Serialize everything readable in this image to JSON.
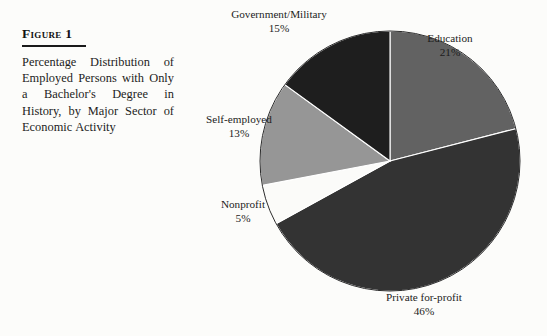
{
  "figure": {
    "label": "Figure 1",
    "caption": "Percentage Distribution of Employed Persons with Only a Bachelor's Degree in History, by Major Sector of Economic Activity"
  },
  "chart_data": {
    "type": "pie",
    "title": "Percentage Distribution of Employed Persons with Only a Bachelor's Degree in History, by Major Sector of Economic Activity",
    "xlabel": "",
    "ylabel": "",
    "legend_position": "none",
    "grid": false,
    "value_suffix": "%",
    "start_angle_deg": 0,
    "direction": "clockwise",
    "categories": [
      "Education",
      "Private for-profit",
      "Nonprofit",
      "Self-employed",
      "Government/Military"
    ],
    "values": [
      21,
      46,
      5,
      13,
      15
    ],
    "colors": [
      "#626262",
      "#333333",
      "#fbfbf9",
      "#969696",
      "#1e1e1e"
    ],
    "slices": [
      {
        "name": "Education",
        "value": 21,
        "value_label": "21%",
        "color": "#626262"
      },
      {
        "name": "Private for-profit",
        "value": 46,
        "value_label": "46%",
        "color": "#333333"
      },
      {
        "name": "Nonprofit",
        "value": 5,
        "value_label": "5%",
        "color": "#fbfbf9"
      },
      {
        "name": "Self-employed",
        "value": 13,
        "value_label": "13%",
        "color": "#969696"
      },
      {
        "name": "Government/Military",
        "value": 15,
        "value_label": "15%",
        "color": "#1e1e1e"
      }
    ]
  }
}
